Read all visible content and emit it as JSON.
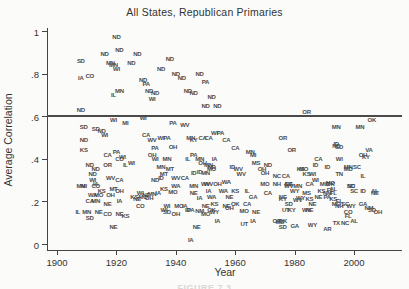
{
  "caption_fragment": "FIGURE 7.3",
  "colors": {
    "background": "#fbfbf9",
    "axis": "#444444",
    "reference_line": "#4a4a4a",
    "marker_text": "#4a4a4a",
    "caption": "#d8d8d4"
  },
  "chart_data": {
    "type": "scatter",
    "marker_style": "state-abbreviation-text",
    "title": "All States, Republican Primaries",
    "xlabel": "Year",
    "ylabel": "Average Correlation",
    "xlim": [
      1897,
      2014
    ],
    "ylim": [
      -0.03,
      1.05
    ],
    "xticks": [
      1900,
      1920,
      1940,
      1960,
      1980,
      2000
    ],
    "ytick_labels": [
      "0",
      ".2",
      ".4",
      ".6",
      ".8",
      "1"
    ],
    "ytick_values": [
      0,
      0.2,
      0.4,
      0.6,
      0.8,
      1
    ],
    "grid": false,
    "reference_line_y": 0.6,
    "points_format": [
      "state",
      "year",
      "value"
    ],
    "points": [
      [
        "ND",
        1920,
        0.97
      ],
      [
        "ND",
        1916,
        0.89
      ],
      [
        "ND",
        1921,
        0.91
      ],
      [
        "ND",
        1927,
        0.89
      ],
      [
        "SD",
        1908,
        0.86
      ],
      [
        "MN",
        1918,
        0.85
      ],
      [
        "MN",
        1919,
        0.84
      ],
      [
        "WI",
        1920,
        0.82
      ],
      [
        "ND",
        1925,
        0.85
      ],
      [
        "ND",
        1935,
        0.82
      ],
      [
        "ND",
        1938,
        0.87
      ],
      [
        "ND",
        1940,
        0.8
      ],
      [
        "ND",
        1942,
        0.78
      ],
      [
        "ND",
        1948,
        0.8
      ],
      [
        "PA",
        1950,
        0.76
      ],
      [
        "ND",
        1929,
        0.77
      ],
      [
        "PA",
        1930,
        0.75
      ],
      [
        "IA",
        1908,
        0.78
      ],
      [
        "CO",
        1911,
        0.79
      ],
      [
        "IL",
        1919,
        0.7
      ],
      [
        "MN",
        1921,
        0.72
      ],
      [
        "ND",
        1931,
        0.72
      ],
      [
        "WI",
        1932,
        0.68
      ],
      [
        "ND",
        1933,
        0.71
      ],
      [
        "ND",
        1944,
        0.72
      ],
      [
        "ND",
        1946,
        0.71
      ],
      [
        "ND",
        1952,
        0.69
      ],
      [
        "ND",
        1950,
        0.65
      ],
      [
        "ND",
        1954,
        0.65
      ],
      [
        "ND",
        1908,
        0.63
      ],
      [
        "OR",
        1984,
        0.62
      ],
      [
        "WI",
        1919,
        0.58
      ],
      [
        "MI",
        1923,
        0.57
      ],
      [
        "SD",
        1909,
        0.55
      ],
      [
        "SD",
        1913,
        0.54
      ],
      [
        "ND",
        1915,
        0.53
      ],
      [
        "WI",
        1916,
        0.51
      ],
      [
        "ND",
        1909,
        0.49
      ],
      [
        "WI",
        1929,
        0.59
      ],
      [
        "PA",
        1939,
        0.57
      ],
      [
        "WV",
        1943,
        0.56
      ],
      [
        "CA",
        1930,
        0.51
      ],
      [
        "WV",
        1932,
        0.49
      ],
      [
        "WI",
        1935,
        0.5
      ],
      [
        "PA",
        1937,
        0.5
      ],
      [
        "MN",
        1945,
        0.5
      ],
      [
        "KY",
        1946,
        0.49
      ],
      [
        "CA",
        1949,
        0.5
      ],
      [
        "CA",
        1951,
        0.5
      ],
      [
        "WI",
        1953,
        0.52
      ],
      [
        "PA",
        1955,
        0.52
      ],
      [
        "CA",
        1957,
        0.49
      ],
      [
        "MN",
        1994,
        0.55
      ],
      [
        "MN",
        2002,
        0.55
      ],
      [
        "OK",
        2006,
        0.58
      ],
      [
        "KS",
        1909,
        0.44
      ],
      [
        "CA",
        1917,
        0.42
      ],
      [
        "PA",
        1920,
        0.43
      ],
      [
        "CO",
        1921,
        0.4
      ],
      [
        "WI",
        1922,
        0.41
      ],
      [
        "PA",
        1933,
        0.45
      ],
      [
        "OH",
        1939,
        0.455
      ],
      [
        "PA",
        1946,
        0.42
      ],
      [
        "CA",
        1960,
        0.45
      ],
      [
        "MN",
        1965,
        0.43
      ],
      [
        "MI",
        1966,
        0.42
      ],
      [
        "OR",
        1976,
        0.5
      ],
      [
        "OR",
        1979,
        0.44
      ],
      [
        "CA",
        1988,
        0.4
      ],
      [
        "ID",
        1994,
        0.47
      ],
      [
        "ND",
        1994,
        0.46
      ],
      [
        "SD",
        1995,
        0.455
      ],
      [
        "VA",
        2005,
        0.44
      ],
      [
        "OH",
        2003,
        0.42
      ],
      [
        "KY",
        2004,
        0.41
      ],
      [
        "WI",
        1995,
        0.4
      ],
      [
        "ND",
        1911,
        0.37
      ],
      [
        "OR",
        1917,
        0.37
      ],
      [
        "IL",
        1923,
        0.37
      ],
      [
        "WI",
        1925,
        0.38
      ],
      [
        "ND",
        1913,
        0.35
      ],
      [
        "OH",
        1932,
        0.42
      ],
      [
        "WI",
        1933,
        0.4
      ],
      [
        "MN",
        1937,
        0.4
      ],
      [
        "IL",
        1944,
        0.4
      ],
      [
        "MN",
        1948,
        0.4
      ],
      [
        "IA",
        1953,
        0.4
      ],
      [
        "OH",
        1949,
        0.38
      ],
      [
        "MN",
        1951,
        0.37
      ],
      [
        "ND",
        1952,
        0.36
      ],
      [
        "MN",
        1935,
        0.36
      ],
      [
        "MT",
        1938,
        0.35
      ],
      [
        "ID",
        1948,
        0.34
      ],
      [
        "MO",
        1952,
        0.35
      ],
      [
        "ID",
        1959,
        0.36
      ],
      [
        "WV",
        1961,
        0.35
      ],
      [
        "MS",
        1967,
        0.38
      ],
      [
        "ND",
        1971,
        0.37
      ],
      [
        "OH",
        1969,
        0.35
      ],
      [
        "KS",
        1982,
        0.35
      ],
      [
        "MO",
        1983,
        0.35
      ],
      [
        "ID",
        1987,
        0.37
      ],
      [
        "WI",
        1986,
        0.33
      ],
      [
        "ID",
        1991,
        0.36
      ],
      [
        "MN",
        1998,
        0.36
      ],
      [
        "MD",
        1998,
        0.35
      ],
      [
        "SC",
        2001,
        0.36
      ],
      [
        "TN",
        1995,
        0.33
      ],
      [
        "IL",
        2003,
        0.32
      ],
      [
        "ND",
        1912,
        0.33
      ],
      [
        "MT",
        1936,
        0.33
      ],
      [
        "ID",
        1946,
        0.335
      ],
      [
        "MN",
        1950,
        0.335
      ],
      [
        "ND",
        1933,
        0.3
      ],
      [
        "ID",
        1935,
        0.31
      ],
      [
        "WV",
        1962,
        0.33
      ],
      [
        "OH",
        1970,
        0.335
      ],
      [
        "NC",
        1974,
        0.32
      ],
      [
        "KS",
        1984,
        0.33
      ],
      [
        "WI",
        1912,
        0.3
      ],
      [
        "IA",
        1913,
        0.28
      ],
      [
        "WV",
        1918,
        0.31
      ],
      [
        "CA",
        1921,
        0.3
      ],
      [
        "WV",
        1940,
        0.31
      ],
      [
        "CA",
        1943,
        0.31
      ],
      [
        "WA",
        1957,
        0.29
      ],
      [
        "WV",
        1950,
        0.28
      ],
      [
        "OH",
        1954,
        0.28
      ],
      [
        "MN",
        1908,
        0.27
      ],
      [
        "MI",
        1909,
        0.27
      ],
      [
        "CO",
        1913,
        0.27
      ],
      [
        "CA",
        1977,
        0.32
      ],
      [
        "WI",
        1987,
        0.3
      ],
      [
        "MO",
        1992,
        0.285
      ],
      [
        "OK",
        1992,
        0.28
      ],
      [
        "NH",
        1974,
        0.28
      ],
      [
        "CA",
        1978,
        0.28
      ],
      [
        "MN",
        1981,
        0.27
      ],
      [
        "MO",
        1970,
        0.28
      ],
      [
        "NE",
        1978,
        0.28
      ],
      [
        "WV",
        1978,
        0.27
      ],
      [
        "CA",
        1985,
        0.28
      ],
      [
        "MO",
        1990,
        0.28
      ],
      [
        "NC",
        1999,
        0.27
      ],
      [
        "SD",
        1999,
        0.27
      ],
      [
        "KS",
        1915,
        0.25
      ],
      [
        "MT",
        1919,
        0.26
      ],
      [
        "OH",
        1921,
        0.25
      ],
      [
        "WA",
        1912,
        0.23
      ],
      [
        "MO",
        1914,
        0.23
      ],
      [
        "OH",
        1918,
        0.23
      ],
      [
        "CA",
        1911,
        0.2
      ],
      [
        "MN",
        1913,
        0.2
      ],
      [
        "NE",
        1917,
        0.19
      ],
      [
        "IA",
        1921,
        0.2
      ],
      [
        "KS",
        1936,
        0.26
      ],
      [
        "WA",
        1940,
        0.27
      ],
      [
        "MN",
        1946,
        0.27
      ],
      [
        "WV",
        1951,
        0.28
      ],
      [
        "MO",
        1939,
        0.245
      ],
      [
        "NE",
        1946,
        0.24
      ],
      [
        "IA",
        1951,
        0.25
      ],
      [
        "WA",
        1956,
        0.25
      ],
      [
        "WI",
        1928,
        0.24
      ],
      [
        "NE",
        1930,
        0.23
      ],
      [
        "MN",
        1932,
        0.235
      ],
      [
        "IA",
        1934,
        0.24
      ],
      [
        "KS",
        1926,
        0.22
      ],
      [
        "MO",
        1929,
        0.22
      ],
      [
        "OH",
        1931,
        0.215
      ],
      [
        "NE",
        1927,
        0.21
      ],
      [
        "WA",
        1952,
        0.22
      ],
      [
        "NE",
        1958,
        0.22
      ],
      [
        "IA",
        1948,
        0.215
      ],
      [
        "KS",
        1960,
        0.25
      ],
      [
        "IL",
        1964,
        0.25
      ],
      [
        "GA",
        1966,
        0.22
      ],
      [
        "CA",
        1971,
        0.24
      ],
      [
        "NE",
        1976,
        0.22
      ],
      [
        "WY",
        1980,
        0.25
      ],
      [
        "MS",
        1984,
        0.24
      ],
      [
        "KS",
        1989,
        0.25
      ],
      [
        "FL",
        1992,
        0.255
      ],
      [
        "NM",
        1991,
        0.24
      ],
      [
        "AL",
        1993,
        0.26
      ],
      [
        "SC",
        2000,
        0.25
      ],
      [
        "ID",
        2003,
        0.25
      ],
      [
        "AL",
        2007,
        0.25
      ],
      [
        "NE",
        2007,
        0.24
      ],
      [
        "FL",
        1993,
        0.24
      ],
      [
        "WV",
        1981,
        0.205
      ],
      [
        "KS",
        1985,
        0.21
      ],
      [
        "NE",
        1988,
        0.22
      ],
      [
        "PA",
        1991,
        0.22
      ],
      [
        "KY",
        1976,
        0.21
      ],
      [
        "WY",
        1982,
        0.215
      ],
      [
        "CO",
        1928,
        0.18
      ],
      [
        "WI",
        1937,
        0.18
      ],
      [
        "MO",
        1941,
        0.18
      ],
      [
        "IA",
        1943,
        0.18
      ],
      [
        "NE",
        1950,
        0.18
      ],
      [
        "KS",
        1953,
        0.19
      ],
      [
        "NE",
        1957,
        0.18
      ],
      [
        "OH",
        1958,
        0.17
      ],
      [
        "SD",
        1937,
        0.15
      ],
      [
        "OH",
        1940,
        0.14
      ],
      [
        "WI",
        1936,
        0.16
      ],
      [
        "ID",
        1944,
        0.16
      ],
      [
        "PA",
        1945,
        0.16
      ],
      [
        "NM",
        1948,
        0.155
      ],
      [
        "OK",
        1952,
        0.16
      ],
      [
        "WY",
        1953,
        0.15
      ],
      [
        "MO",
        1950,
        0.14
      ],
      [
        "IL",
        1907,
        0.15
      ],
      [
        "MN",
        1910,
        0.15
      ],
      [
        "SD",
        1911,
        0.12
      ],
      [
        "NE",
        1914,
        0.15
      ],
      [
        "CO",
        1917,
        0.14
      ],
      [
        "NE",
        1921,
        0.14
      ],
      [
        "KS",
        1923,
        0.13
      ],
      [
        "OK",
        1960,
        0.19
      ],
      [
        "CA",
        1964,
        0.19
      ],
      [
        "MO",
        1963,
        0.155
      ],
      [
        "NE",
        1967,
        0.15
      ],
      [
        "UT",
        1977,
        0.16
      ],
      [
        "KY",
        1979,
        0.16
      ],
      [
        "WY",
        1984,
        0.16
      ],
      [
        "NE",
        1985,
        0.16
      ],
      [
        "NE",
        1986,
        0.19
      ],
      [
        "SD",
        1978,
        0.19
      ],
      [
        "KS",
        1993,
        0.21
      ],
      [
        "FL",
        1995,
        0.2
      ],
      [
        "MO",
        1994,
        0.19
      ],
      [
        "NH",
        1995,
        0.18
      ],
      [
        "SC",
        1997,
        0.19
      ],
      [
        "WY",
        1999,
        0.18
      ],
      [
        "GA",
        2003,
        0.19
      ],
      [
        "CO",
        1998,
        0.15
      ],
      [
        "FL",
        1998,
        0.13
      ],
      [
        "NM",
        2005,
        0.17
      ],
      [
        "SD",
        2006,
        0.16
      ],
      [
        "OH",
        2008,
        0.15
      ],
      [
        "NE",
        1919,
        0.08
      ],
      [
        "NE",
        1947,
        0.08
      ],
      [
        "IA",
        1945,
        0.02
      ],
      [
        "IA",
        1954,
        0.11
      ],
      [
        "UT",
        1963,
        0.095
      ],
      [
        "IA",
        1966,
        0.11
      ],
      [
        "OR",
        1974,
        0.11
      ],
      [
        "OK",
        1976,
        0.11
      ],
      [
        "MS",
        1975,
        0.105
      ],
      [
        "SD",
        1976,
        0.08
      ],
      [
        "GA",
        1980,
        0.085
      ],
      [
        "WY",
        1986,
        0.09
      ],
      [
        "AR",
        1991,
        0.07
      ],
      [
        "TX",
        1994,
        0.1
      ],
      [
        "NC",
        1997,
        0.1
      ],
      [
        "AL",
        2000,
        0.11
      ]
    ]
  }
}
